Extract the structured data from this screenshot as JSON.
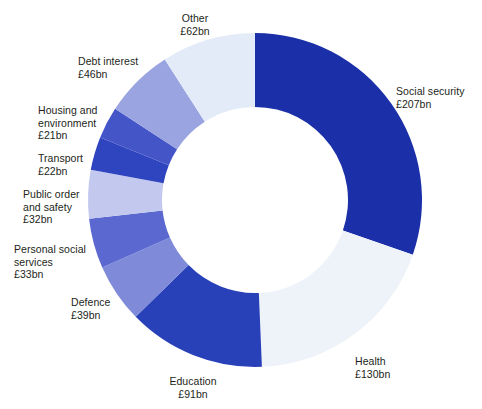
{
  "chart_data": {
    "type": "pie",
    "variant": "donut",
    "title": "",
    "subtitle": "",
    "xlabel": "",
    "ylabel": "",
    "units": "£bn",
    "total": 683,
    "start_angle_deg": 0,
    "direction": "clockwise",
    "inner_radius_ratio": 0.56,
    "legend": "none (direct labels)",
    "grid": false,
    "categories": [
      "Social security",
      "Health",
      "Education",
      "Defence",
      "Personal social services",
      "Public order and safety",
      "Transport",
      "Housing and environment",
      "Debt interest",
      "Other"
    ],
    "values": [
      207,
      130,
      91,
      39,
      33,
      32,
      22,
      21,
      46,
      62
    ],
    "value_labels": [
      "£207bn",
      "£130bn",
      "£91bn",
      "£39bn",
      "£33bn",
      "£32bn",
      "£22bn",
      "£21bn",
      "£46bn",
      "£62bn"
    ],
    "colors": [
      "#1a2fa8",
      "#eef3fa",
      "#2840b8",
      "#7f8bd8",
      "#5a68d0",
      "#c3c9ee",
      "#2f45c0",
      "#4455c8",
      "#9aa4e0",
      "#e2ebf7"
    ],
    "slices": [
      {
        "name": "Social security",
        "value": 207,
        "label": "Social security",
        "amount": "£207bn",
        "color": "#1a2fa8"
      },
      {
        "name": "Health",
        "value": 130,
        "label": "Health",
        "amount": "£130bn",
        "color": "#eef3fa"
      },
      {
        "name": "Education",
        "value": 91,
        "label": "Education",
        "amount": "£91bn",
        "color": "#2840b8"
      },
      {
        "name": "Defence",
        "value": 39,
        "label": "Defence",
        "amount": "£39bn",
        "color": "#7f8bd8"
      },
      {
        "name": "Personal social services",
        "value": 33,
        "label": "Personal social\nservices",
        "amount": "£33bn",
        "color": "#5a68d0"
      },
      {
        "name": "Public order and safety",
        "value": 32,
        "label": "Public order\nand safety",
        "amount": "£32bn",
        "color": "#c3c9ee"
      },
      {
        "name": "Transport",
        "value": 22,
        "label": "Transport",
        "amount": "£22bn",
        "color": "#2f45c0"
      },
      {
        "name": "Housing and environment",
        "value": 21,
        "label": "Housing and\nenvironment",
        "amount": "£21bn",
        "color": "#4455c8"
      },
      {
        "name": "Debt interest",
        "value": 46,
        "label": "Debt interest",
        "amount": "£46bn",
        "color": "#9aa4e0"
      },
      {
        "name": "Other",
        "value": 62,
        "label": "Other",
        "amount": "£62bn",
        "color": "#e2ebf7"
      }
    ]
  },
  "labels": {
    "social_security": {
      "text": "Social security\n£207bn"
    },
    "health": {
      "text": "Health\n£130bn"
    },
    "education": {
      "text": "Education\n£91bn"
    },
    "defence": {
      "text": "Defence\n£39bn"
    },
    "personal_social": {
      "text": "Personal social\nservices\n£33bn"
    },
    "public_order": {
      "text": "Public order\nand safety\n£32bn"
    },
    "transport": {
      "text": "Transport\n£22bn"
    },
    "housing": {
      "text": "Housing and\nenvironment\n£21bn"
    },
    "debt_interest": {
      "text": "Debt interest\n£46bn"
    },
    "other": {
      "text": "Other\n£62bn"
    }
  },
  "geometry": {
    "center_x": 255,
    "center_y": 200,
    "outer_radius": 167,
    "inner_radius": 93,
    "background": "#ffffff"
  }
}
